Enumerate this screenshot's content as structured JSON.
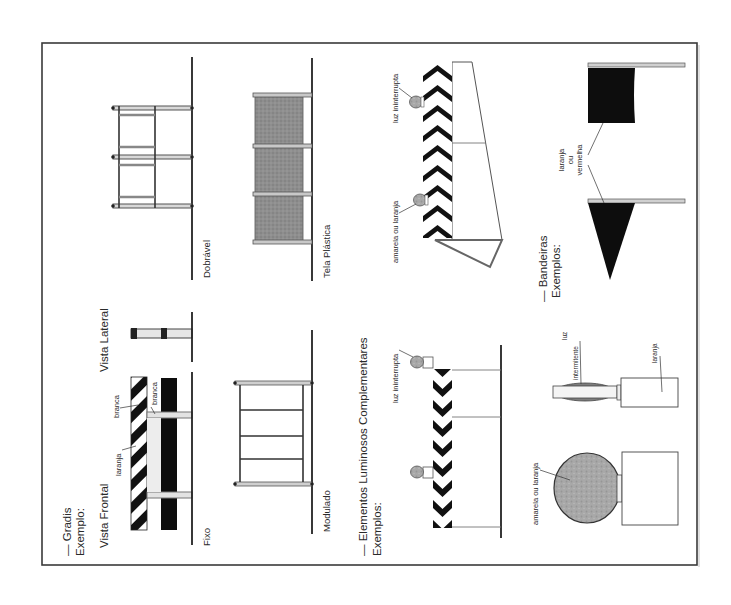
{
  "figure": {
    "orientation": "rotated-90-ccw",
    "colors": {
      "ink": "#2a2a2a",
      "frame": "#3a3a3a",
      "mesh_gray": "#8c8c8c",
      "lamp_gray": "#a9a9a9",
      "rail_light": "#bdbdbd",
      "background": "#ffffff"
    }
  },
  "gradis": {
    "heading": "— Gradis",
    "example_label": "Exemplo:",
    "front_view_label": "Vista Frontal",
    "side_view_label": "Vista Lateral",
    "stripe_label_orange": "laranja",
    "stripe_label_white": "branca",
    "stripe_label_white_2": "branca",
    "types": {
      "fixed": "Fixo",
      "folding": "Dobrável",
      "modular": "Modulado",
      "plastic_mesh": "Tela Plástica"
    }
  },
  "luminosos": {
    "heading": "— Elementos Luminosos Complementares",
    "examples_label": "Exemplos:",
    "continuous_light_label_1": "luz ininterrupta",
    "continuous_light_label_2": "luz ininterrupta",
    "color_label": "amarela ou laranja"
  },
  "bandeiras": {
    "heading": "— Bandeiras",
    "examples_label": "Exemplos:",
    "flag_color_line1": "laranja",
    "flag_color_line2": "ou",
    "flag_color_line3": "vermelha"
  },
  "lamps": {
    "round_lamp_color_label": "amarela ou laranja",
    "flashing_light_label_line1": "luz",
    "flashing_light_label_line2": "intermitente",
    "box_color_label": "laranja"
  }
}
